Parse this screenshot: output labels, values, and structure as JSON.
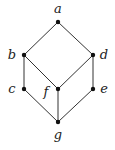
{
  "diagram": {
    "type": "hasse-diagram",
    "nodes": [
      {
        "id": "a",
        "label": "a"
      },
      {
        "id": "b",
        "label": "b"
      },
      {
        "id": "d",
        "label": "d"
      },
      {
        "id": "c",
        "label": "c"
      },
      {
        "id": "f",
        "label": "f"
      },
      {
        "id": "e",
        "label": "e"
      },
      {
        "id": "g",
        "label": "g"
      }
    ],
    "edges": [
      [
        "a",
        "b"
      ],
      [
        "a",
        "d"
      ],
      [
        "b",
        "c"
      ],
      [
        "b",
        "f"
      ],
      [
        "d",
        "f"
      ],
      [
        "d",
        "e"
      ],
      [
        "c",
        "g"
      ],
      [
        "f",
        "g"
      ],
      [
        "e",
        "g"
      ]
    ]
  }
}
